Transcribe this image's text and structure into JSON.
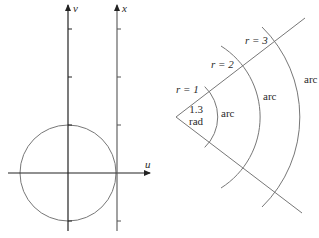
{
  "left_diagram": {
    "axes": {
      "v_label": "v",
      "x_label": "x",
      "u_label": "u"
    },
    "circle": {
      "center": "origin",
      "radius_ticks": 1
    },
    "colors": {
      "axis": "#222222",
      "circle": "#777777",
      "line": "#777777"
    }
  },
  "right_diagram": {
    "angle_label_line1": "1.3",
    "angle_label_line2": "rad",
    "radius_labels": [
      "r = 1",
      "r = 2",
      "r = 3"
    ],
    "arc_labels": [
      "arc",
      "arc",
      "arc"
    ],
    "angle_radians": 1.3,
    "radii": [
      1,
      2,
      3
    ],
    "colors": {
      "ray": "#777777",
      "arc": "#777777",
      "text": "#2a2a2a"
    }
  }
}
